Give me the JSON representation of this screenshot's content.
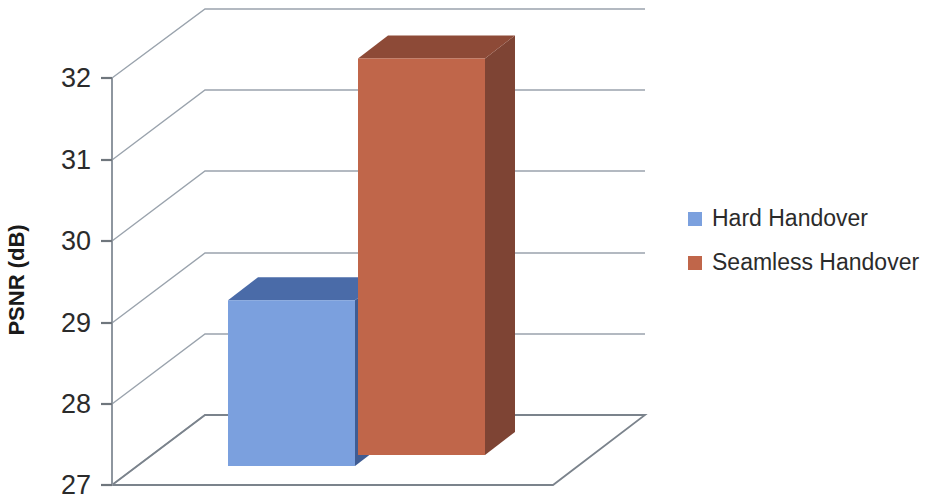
{
  "chart_data": {
    "type": "bar",
    "title": "",
    "subtitle": "",
    "xlabel": "",
    "ylabel": "PSNR (dB)",
    "categories": [
      "Handover"
    ],
    "series": [
      {
        "name": "Hard Handover",
        "values": [
          29.27
        ],
        "color": "#7ba0de"
      },
      {
        "name": "Seamless Handover",
        "values": [
          32.24
        ],
        "color": "#c0664a"
      }
    ],
    "ylim": [
      27,
      32
    ],
    "yticks": [
      27,
      28,
      29,
      30,
      31,
      32
    ],
    "ytick_labels": [
      "27",
      "28",
      "29",
      "30",
      "31",
      "32"
    ],
    "grid": true,
    "grid_axis": "y",
    "legend_position": "right",
    "three_d": true,
    "annotations": []
  },
  "axis": {
    "y_title": "PSNR (dB)",
    "tick_labels": [
      "32",
      "31",
      "30",
      "29",
      "28",
      "27"
    ]
  },
  "legend": {
    "items": [
      {
        "label": "Hard Handover",
        "swatch_color": "#7ba0de",
        "name": "legend-item-hard-handover"
      },
      {
        "label": "Seamless Handover",
        "swatch_color": "#c0664a",
        "name": "legend-item-seamless-handover"
      }
    ]
  },
  "colors": {
    "series_blue_front": "#7ba0de",
    "series_blue_top": "#4a6ba8",
    "series_blue_side": "#3f5c93",
    "series_red_front": "#c0664a",
    "series_red_top": "#8d4a37",
    "series_red_side": "#7e4434",
    "grid": "#9aa3ad",
    "axis": "#8e969f",
    "text": "#2b2b2b",
    "background": "#ffffff"
  }
}
